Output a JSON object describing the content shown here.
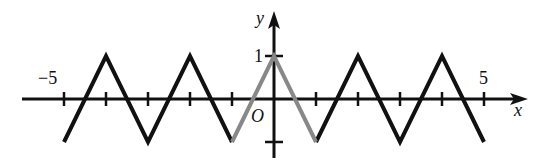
{
  "chart_data": {
    "type": "line",
    "title": "",
    "xlabel": "x",
    "ylabel": "y",
    "origin_label": "O",
    "xlim": [
      -5.5,
      6
    ],
    "ylim": [
      -1.4,
      2
    ],
    "grid": false,
    "x_tick_labels": [
      {
        "value": -5,
        "label": "−5"
      },
      {
        "value": 5,
        "label": "5"
      }
    ],
    "y_tick_labels": [
      {
        "value": 1,
        "label": "1"
      }
    ],
    "x_ticks": [
      -5,
      -4,
      -3,
      -2,
      -1,
      1,
      2,
      3,
      4,
      5
    ],
    "y_ticks": [
      1,
      -1
    ],
    "series": [
      {
        "name": "periodic extension (black)",
        "color": "#111111",
        "segments": [
          [
            [
              -5,
              -1
            ],
            [
              -4,
              1
            ],
            [
              -3,
              -1
            ],
            [
              -2,
              1
            ],
            [
              -1,
              -1
            ]
          ],
          [
            [
              1,
              -1
            ],
            [
              2,
              1
            ],
            [
              3,
              -1
            ],
            [
              4,
              1
            ],
            [
              5,
              -1
            ]
          ]
        ]
      },
      {
        "name": "base piece on [-1,1] (gray)",
        "color": "#888888",
        "segments": [
          [
            [
              -1,
              -1
            ],
            [
              0,
              1
            ],
            [
              1,
              -1
            ]
          ]
        ]
      }
    ]
  },
  "labels": {
    "x_axis": "x",
    "y_axis": "y",
    "origin": "O",
    "tick_neg5": "−5",
    "tick_5": "5",
    "tick_1": "1"
  }
}
